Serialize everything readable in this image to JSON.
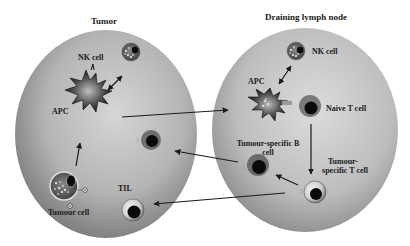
{
  "diagram": {
    "compartments": {
      "tumor": {
        "title": "Tumor"
      },
      "lymph_node": {
        "title": "Draining lymph node"
      }
    },
    "tumor_labels": {
      "nk_cell": "NK cell",
      "apc": "APC",
      "tumour_cell": "Tumour cell",
      "til": "TIL"
    },
    "lymph_labels": {
      "nk_cell": "NK cell",
      "apc": "APC",
      "naive_t_cell": "Naive T cell",
      "b_cell_line1": "Tumour-specific B",
      "b_cell_line2": "cell",
      "t_cell_line1": "Tumour-",
      "t_cell_line2": "specific T cell"
    },
    "arrows": [
      {
        "from": "tumour_cell",
        "to": "apc_tumor"
      },
      {
        "from": "apc_tumor",
        "to": "nk_cell_tumor",
        "bidirectional": true
      },
      {
        "from": "apc_tumor",
        "to": "apc_lymph"
      },
      {
        "from": "apc_lymph",
        "to": "nk_cell_lymph",
        "bidirectional": true
      },
      {
        "from": "naive_t_cell",
        "to": "tumour_specific_t_cell"
      },
      {
        "from": "tumour_specific_t_cell",
        "to": "tumour_specific_b_cell"
      },
      {
        "from": "tumour_specific_b_cell",
        "to": "tumor_b_cell"
      },
      {
        "from": "tumour_specific_t_cell",
        "to": "til"
      }
    ],
    "colors": {
      "ellipse_light": "#d2d2d2",
      "ellipse_dark": "#6e6e6e",
      "arrow": "#1a1a1a",
      "nucleus": "#0a0a0a"
    }
  }
}
